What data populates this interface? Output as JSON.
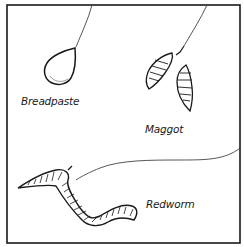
{
  "illustration": {
    "subject": "fishing bait types",
    "baits": [
      {
        "id": "breadpaste",
        "label": "Breadpaste"
      },
      {
        "id": "maggot",
        "label": "Maggot"
      },
      {
        "id": "redworm",
        "label": "Redworm"
      }
    ]
  }
}
